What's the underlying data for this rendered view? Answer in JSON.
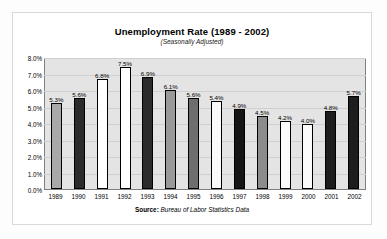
{
  "card": {
    "source_label": "Source:",
    "source_text": "Bureau of Labor Statistics Data"
  },
  "chart_data": {
    "type": "bar",
    "title": "Unemployment Rate (1989 - 2002)",
    "subtitle": "(Seasonally Adjusted)",
    "xlabel": "",
    "ylabel": "",
    "ylim": [
      0,
      8
    ],
    "grid": true,
    "legend": "none",
    "categories": [
      "1989",
      "1990",
      "1991",
      "1992",
      "1993",
      "1994",
      "1995",
      "1996",
      "1997",
      "1998",
      "1999",
      "2000",
      "2001",
      "2002"
    ],
    "values": [
      5.3,
      5.6,
      6.8,
      7.5,
      6.9,
      6.1,
      5.6,
      5.4,
      4.9,
      4.5,
      4.2,
      4.0,
      4.8,
      5.7
    ],
    "data_labels": [
      "5.3%",
      "5.6%",
      "6.8%",
      "7.5%",
      "6.9%",
      "6.1%",
      "5.6%",
      "5.4%",
      "4.9%",
      "4.5%",
      "4.2%",
      "4.0%",
      "4.8%",
      "5.7%"
    ],
    "bar_colors": [
      "#a9a9a9",
      "#2b2b2b",
      "#ffffff",
      "#ffffff",
      "#2b2b2b",
      "#999999",
      "#6e6e6e",
      "#fafafa",
      "#151515",
      "#8c8c8c",
      "#fbfbfb",
      "#fbfbfb",
      "#1d1d1d",
      "#1d1d1d"
    ],
    "ytick_labels": [
      "8.0%",
      "7.0%",
      "6.0%",
      "5.0%",
      "4.0%",
      "3.0%",
      "2.0%",
      "1.0%",
      "0.0%"
    ],
    "ytick_values": [
      8,
      7,
      6,
      5,
      4,
      3,
      2,
      1,
      0
    ],
    "plot_background": "#e4e4e4",
    "gridline_color": "#cfcfcf",
    "bar_border_color": "#000000"
  }
}
